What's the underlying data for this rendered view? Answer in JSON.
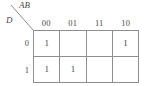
{
  "diagram": {
    "type": "karnaugh-map",
    "corner": {
      "top_right_label": "AB",
      "bottom_left_label": "D",
      "divider": "diagonal-line"
    },
    "column_variable": "AB",
    "row_variable": "D",
    "column_headers": [
      "00",
      "01",
      "11",
      "10"
    ],
    "row_headers": [
      "0",
      "1"
    ],
    "rows": [
      {
        "header": "0",
        "cells": [
          "1",
          "",
          "",
          "1"
        ]
      },
      {
        "header": "1",
        "cells": [
          "1",
          "1",
          "",
          ""
        ]
      }
    ],
    "colors": {
      "line": "#8e8e8e",
      "text": "#444444",
      "background": "#ffffff"
    }
  }
}
